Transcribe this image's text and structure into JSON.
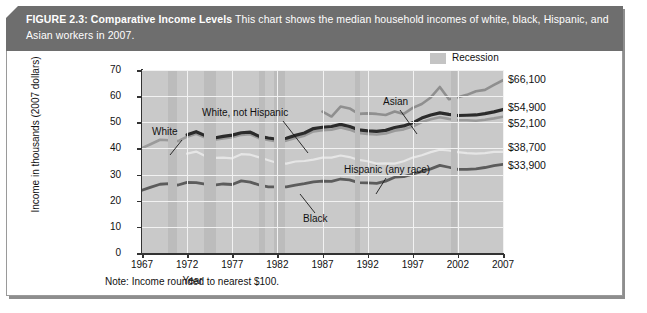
{
  "header": {
    "figure_label": "FIGURE 2.3:",
    "figure_title": "Comparative Income Levels",
    "description": "This chart shows the median household incomes of white, black, Hispanic, and Asian workers in 2007."
  },
  "legend": {
    "items": [
      {
        "label": "Recession",
        "color": "#c4c4c4"
      }
    ]
  },
  "note": "Note: Income rounded to nearest $100.",
  "value_labels": [
    {
      "text": "$66,100",
      "series": "Asian"
    },
    {
      "text": "$54,900",
      "series": "White, not Hispanic"
    },
    {
      "text": "$52,100",
      "series": "White"
    },
    {
      "text": "$38,700",
      "series": "Hispanic (any race)"
    },
    {
      "text": "$33,900",
      "series": "Black"
    }
  ],
  "series_labels": [
    {
      "text": "White"
    },
    {
      "text": "White, not Hispanic"
    },
    {
      "text": "Asian"
    },
    {
      "text": "Hispanic (any race)"
    },
    {
      "text": "Black"
    }
  ],
  "chart_data": {
    "type": "line",
    "title": "Comparative Income Levels",
    "subtitle": "Median household incomes of white, black, Hispanic, and Asian workers in 2007",
    "xlabel": "Year",
    "ylabel": "Income in thousands (2007 dollars)",
    "xlim": [
      1967,
      2007
    ],
    "ylim": [
      0,
      70
    ],
    "yticks": [
      0,
      10,
      20,
      30,
      40,
      50,
      60,
      70
    ],
    "ytick_labels": [
      "0",
      "10",
      "20",
      "30",
      "40",
      "50",
      "60",
      "70"
    ],
    "xticks": [
      1967,
      1972,
      1977,
      1982,
      1987,
      1992,
      1997,
      2002,
      2007
    ],
    "xtick_labels": [
      "1967",
      "1972",
      "1977",
      "1982",
      "1987",
      "1992",
      "1997",
      "2002",
      "2007"
    ],
    "grid": true,
    "legend_position": "top-right",
    "units": "thousands of 2007 dollars",
    "note": "Income rounded to nearest $100.",
    "recession_bands": [
      [
        1969.9,
        1970.9
      ],
      [
        1973.9,
        1975.2
      ],
      [
        1980.0,
        1980.6
      ],
      [
        1981.6,
        1982.9
      ],
      [
        1990.6,
        1991.2
      ],
      [
        2001.2,
        2001.9
      ]
    ],
    "series": [
      {
        "name": "White",
        "color": "#9a9a9a",
        "width": 2.6,
        "end_value": 52.1,
        "x": [
          1967,
          1968,
          1969,
          1970,
          1971,
          1972,
          1973,
          1974,
          1975,
          1976,
          1977,
          1978,
          1979,
          1980,
          1981,
          1982,
          1983,
          1984,
          1985,
          1986,
          1987,
          1988,
          1989,
          1990,
          1991,
          1992,
          1993,
          1994,
          1995,
          1996,
          1997,
          1998,
          1999,
          2000,
          2001,
          2002,
          2003,
          2004,
          2005,
          2006,
          2007
        ],
        "values": [
          40.1,
          41.7,
          43.3,
          43.1,
          42.8,
          44.5,
          45.6,
          44.2,
          43.3,
          43.8,
          44.3,
          45.2,
          45.4,
          43.9,
          43.2,
          42.7,
          43.0,
          44.0,
          44.9,
          46.5,
          47.0,
          47.2,
          48.0,
          47.2,
          45.9,
          45.5,
          45.3,
          45.7,
          46.8,
          47.3,
          48.4,
          50.1,
          51.2,
          51.9,
          51.3,
          50.8,
          50.8,
          50.6,
          51.0,
          51.5,
          52.1
        ]
      },
      {
        "name": "White, not Hispanic",
        "color": "#2b2b2b",
        "width": 3.2,
        "end_value": 54.9,
        "x": [
          1972,
          1973,
          1974,
          1975,
          1976,
          1977,
          1978,
          1979,
          1980,
          1981,
          1982,
          1983,
          1984,
          1985,
          1986,
          1987,
          1988,
          1989,
          1990,
          1991,
          1992,
          1993,
          1994,
          1995,
          1996,
          1997,
          1998,
          1999,
          2000,
          2001,
          2002,
          2003,
          2004,
          2005,
          2006,
          2007
        ],
        "values": [
          45.2,
          46.4,
          44.9,
          44.0,
          44.6,
          45.1,
          46.0,
          46.2,
          44.6,
          44.0,
          43.5,
          43.9,
          45.0,
          45.9,
          47.6,
          48.1,
          48.4,
          49.2,
          48.4,
          47.1,
          46.7,
          46.5,
          46.9,
          48.0,
          48.6,
          49.8,
          51.6,
          52.8,
          53.6,
          53.0,
          52.6,
          52.7,
          52.8,
          53.3,
          54.0,
          54.9
        ]
      },
      {
        "name": "Asian",
        "color": "#8f8f8f",
        "width": 2.6,
        "end_value": 66.1,
        "x": [
          1987,
          1988,
          1989,
          1990,
          1991,
          1992,
          1993,
          1994,
          1995,
          1996,
          1997,
          1998,
          1999,
          2000,
          2001,
          2002,
          2003,
          2004,
          2005,
          2006,
          2007
        ],
        "values": [
          54.1,
          52.2,
          56.0,
          55.3,
          53.2,
          53.4,
          53.2,
          52.8,
          54.1,
          53.2,
          55.5,
          57.0,
          59.5,
          63.5,
          58.8,
          59.6,
          60.5,
          61.9,
          62.4,
          64.3,
          66.1
        ]
      },
      {
        "name": "Hispanic (any race)",
        "color": "#e6e6e6",
        "width": 2.2,
        "end_value": 38.7,
        "x": [
          1972,
          1973,
          1974,
          1975,
          1976,
          1977,
          1978,
          1979,
          1980,
          1981,
          1982,
          1983,
          1984,
          1985,
          1986,
          1987,
          1988,
          1989,
          1990,
          1991,
          1992,
          1993,
          1994,
          1995,
          1996,
          1997,
          1998,
          1999,
          2000,
          2001,
          2002,
          2003,
          2004,
          2005,
          2006,
          2007
        ],
        "values": [
          38.0,
          38.8,
          37.1,
          36.4,
          36.5,
          36.2,
          37.8,
          37.6,
          36.6,
          35.5,
          34.4,
          34.2,
          35.0,
          35.2,
          35.7,
          36.5,
          36.5,
          37.3,
          36.7,
          35.6,
          35.1,
          34.2,
          34.3,
          34.2,
          35.1,
          36.5,
          37.4,
          38.6,
          39.5,
          39.2,
          38.6,
          38.2,
          38.0,
          38.2,
          38.7,
          38.7
        ]
      },
      {
        "name": "Black",
        "color": "#5c5c5c",
        "width": 2.8,
        "end_value": 33.9,
        "x": [
          1967,
          1968,
          1969,
          1970,
          1971,
          1972,
          1973,
          1974,
          1975,
          1976,
          1977,
          1978,
          1979,
          1980,
          1981,
          1982,
          1983,
          1984,
          1985,
          1986,
          1987,
          1988,
          1989,
          1990,
          1991,
          1992,
          1993,
          1994,
          1995,
          1996,
          1997,
          1998,
          1999,
          2000,
          2001,
          2002,
          2003,
          2004,
          2005,
          2006,
          2007
        ],
        "values": [
          24.0,
          25.2,
          26.3,
          26.5,
          26.0,
          27.0,
          26.9,
          26.3,
          26.0,
          26.4,
          26.2,
          27.6,
          27.1,
          26.0,
          25.3,
          25.3,
          25.3,
          26.0,
          26.5,
          27.2,
          27.5,
          27.4,
          28.3,
          28.0,
          26.9,
          26.8,
          26.6,
          27.5,
          29.0,
          29.2,
          30.2,
          31.2,
          32.2,
          33.5,
          32.8,
          32.0,
          32.0,
          32.2,
          32.7,
          33.4,
          33.9
        ]
      }
    ]
  }
}
